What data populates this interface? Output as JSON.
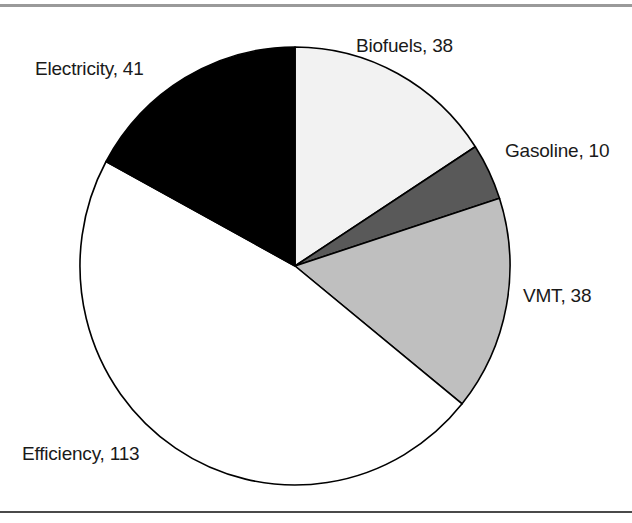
{
  "chart_data": {
    "type": "pie",
    "title": "",
    "subtitle": "",
    "xlabel": "",
    "ylabel": "",
    "total": 240,
    "legend_position": "none",
    "label_format": "name, value",
    "start_angle_deg": 0,
    "direction": "clockwise",
    "grid": false,
    "categories": [
      "Biofuels",
      "Gasoline",
      "VMT",
      "Efficiency",
      "Electricity"
    ],
    "values": [
      38,
      10,
      38,
      113,
      41
    ],
    "slices": [
      {
        "name": "Biofuels",
        "value": 38,
        "label": "Biofuels, 38",
        "fill": "#f2f2f2",
        "stroke": "#000000",
        "start_angle_deg": 0,
        "sweep_deg": 57,
        "percent": 15.8
      },
      {
        "name": "Gasoline",
        "value": 10,
        "label": "Gasoline, 10",
        "fill": "#595959",
        "stroke": "#000000",
        "start_angle_deg": 57,
        "sweep_deg": 15,
        "percent": 4.2
      },
      {
        "name": "VMT",
        "value": 38,
        "label": "VMT, 38",
        "fill": "#bfbfbf",
        "stroke": "#000000",
        "start_angle_deg": 72,
        "sweep_deg": 57,
        "percent": 15.8
      },
      {
        "name": "Efficiency",
        "value": 113,
        "label": "Efficiency, 113",
        "fill": "#ffffff",
        "stroke": "#000000",
        "start_angle_deg": 129,
        "sweep_deg": 169.5,
        "percent": 47.1
      },
      {
        "name": "Electricity",
        "value": 41,
        "label": "Electricity, 41",
        "fill": "#000000",
        "stroke": "#000000",
        "start_angle_deg": 298.5,
        "sweep_deg": 61.5,
        "percent": 17.1
      }
    ]
  },
  "figure": {
    "rule_color_top": "#9a9a9a",
    "rule_color_bottom": "#4a4a4a",
    "background": "#ffffff",
    "text_color": "#1a1a1a"
  }
}
